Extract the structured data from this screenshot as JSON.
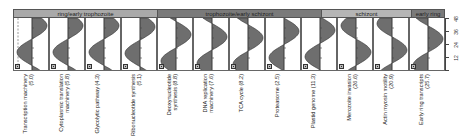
{
  "chart_data": {
    "type": "area",
    "title": "",
    "orientation": "vertical-profiles",
    "ylabel": "Hours post-invasion",
    "y_ticks": [
      48,
      36,
      24,
      12
    ],
    "ylim": [
      0,
      48
    ],
    "stages": [
      {
        "label": "ring/early trophozoite",
        "panels": 4,
        "color": "#a9a9a9"
      },
      {
        "label": "trophozoite/early schizont",
        "panels": 5,
        "color": "#7a7a7a"
      },
      {
        "label": "schizont",
        "panels": 2,
        "color": "#b5b5b5"
      },
      {
        "label": "early ring",
        "panels": 1,
        "color": "#7a7a7a"
      }
    ],
    "series": [
      {
        "name": "Transcription machinery",
        "value": 5.0,
        "peak_hour": 41
      },
      {
        "name": "Cytoplasmic translation machinery",
        "value": 5.8,
        "peak_hour": 41
      },
      {
        "name": "Glycolytic pathway",
        "value": 4.3,
        "peak_hour": 41
      },
      {
        "name": "Ribonucleotide synthesis",
        "value": 5.1,
        "peak_hour": 40
      },
      {
        "name": "Deoxynucleotide synthesis",
        "value": 8.8,
        "peak_hour": 33
      },
      {
        "name": "DNA replication machinery",
        "value": 7.6,
        "peak_hour": 31
      },
      {
        "name": "TCA cycle",
        "value": 8.2,
        "peak_hour": 30
      },
      {
        "name": "Proteasome",
        "value": 2.5,
        "peak_hour": 36
      },
      {
        "name": "Plastid genome",
        "value": 11.3,
        "peak_hour": 37
      },
      {
        "name": "Merozoite invasion",
        "value": 26.6,
        "peak_hour": 17
      },
      {
        "name": "Actin myosin motility",
        "value": 20.9,
        "peak_hour": 19
      },
      {
        "name": "Early ring transcripts",
        "value": 25.7,
        "peak_hour": 29
      }
    ]
  },
  "stages": [
    {
      "label": "ring/early trophozoite"
    },
    {
      "label": "trophozoite/early schizont"
    },
    {
      "label": "schizont"
    },
    {
      "label": "early ring"
    }
  ],
  "panels": [
    {
      "label": "Transcription machinery (5.0)"
    },
    {
      "label": "Cytoplasmic translation machinery (5.8)"
    },
    {
      "label": "Glycolytic pathway (4.3)"
    },
    {
      "label": "Ribonucleotide synthesis (5.1)"
    },
    {
      "label": "Deoxynucleotide synthesis (8.8)"
    },
    {
      "label": "DNA replication machinery (7.6)"
    },
    {
      "label": "TCA cycle (8.2)"
    },
    {
      "label": "Proteasome (2.5)"
    },
    {
      "label": "Plastid genome (11.3)"
    },
    {
      "label": "Merozoite invasion (26.6)"
    },
    {
      "label": "Actin myosin motility (20.9)"
    },
    {
      "label": "Early ring transcripts (25.7)"
    }
  ],
  "axis": {
    "ticks": [
      "48",
      "36",
      "24",
      "12"
    ]
  }
}
